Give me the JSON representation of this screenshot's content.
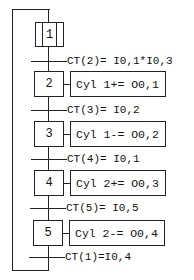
{
  "diagram": {
    "type": "GRAFCET",
    "steps": [
      {
        "id": "1",
        "initial": true,
        "action": null
      },
      {
        "id": "2",
        "initial": false,
        "action": "Cyl 1+= O0,1"
      },
      {
        "id": "3",
        "initial": false,
        "action": "Cyl 1-= O0,2"
      },
      {
        "id": "4",
        "initial": false,
        "action": "Cyl 2+= O0,3"
      },
      {
        "id": "5",
        "initial": false,
        "action": "Cyl 2-= O0,4"
      }
    ],
    "transitions": [
      {
        "label": "CT(2)= I0,1*I0,3"
      },
      {
        "label": "CT(3)= I0,2"
      },
      {
        "label": "CT(4)= I0,1"
      },
      {
        "label": "CT(5)= I0,5"
      },
      {
        "label": "CT(1)=I0,4"
      }
    ]
  }
}
